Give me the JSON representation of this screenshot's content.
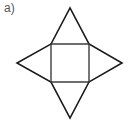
{
  "figure": {
    "panel_label": "a)",
    "caption": "",
    "colors": {
      "background": "#ffffff",
      "stroke_dark": "#1a1a1a",
      "stroke_square": "#3d3d3d",
      "label_text": "#555555"
    },
    "canvas": {
      "width": 130,
      "height": 125
    },
    "geometry": {
      "square": {
        "name": "central-square",
        "top_left": [
          51,
          44
        ],
        "top_right": [
          89,
          44
        ],
        "bottom_right": [
          89,
          82
        ],
        "bottom_left": [
          51,
          82
        ],
        "side_length": 38
      },
      "apexes": {
        "top": [
          70,
          8
        ],
        "right": [
          122,
          63
        ],
        "bottom": [
          70,
          118
        ],
        "left": [
          17,
          63
        ]
      },
      "triangles": [
        {
          "name": "top-triangle",
          "points": "51,44 89,44 70,8"
        },
        {
          "name": "right-triangle",
          "points": "89,44 89,82 122,63"
        },
        {
          "name": "bottom-triangle",
          "points": "51,82 89,82 70,118"
        },
        {
          "name": "left-triangle",
          "points": "51,44 51,82 17,63"
        }
      ],
      "stroke_widths": {
        "triangle": 1.6,
        "square": 1.4
      }
    }
  }
}
